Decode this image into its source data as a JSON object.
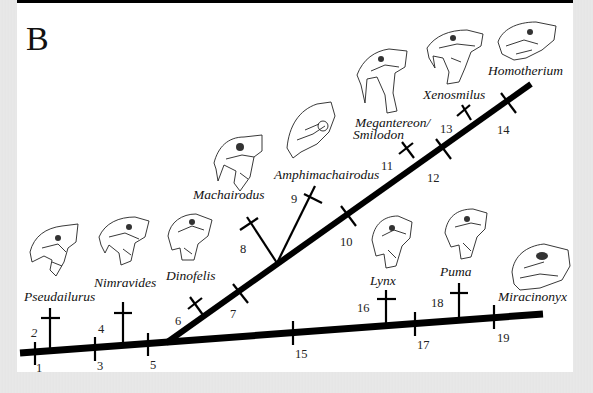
{
  "panel": {
    "label": "B"
  },
  "colors": {
    "line": "#000000",
    "background": "#ffffff",
    "frame": "#e6e6e6"
  },
  "taxa": [
    {
      "id": "pseudailurus",
      "name": "Pseudailurus"
    },
    {
      "id": "nimravides",
      "name": "Nimravides"
    },
    {
      "id": "dinofelis",
      "name": "Dinofelis"
    },
    {
      "id": "machairodus",
      "name": "Machairodus"
    },
    {
      "id": "amphimachairodus",
      "name": "Amphimachairodus"
    },
    {
      "id": "megantereon",
      "name": "Megantereon/"
    },
    {
      "id": "smilodon",
      "name": "Smilodon"
    },
    {
      "id": "xenosmilus",
      "name": "Xenosmilus"
    },
    {
      "id": "homotherium",
      "name": "Homotherium"
    },
    {
      "id": "lynx",
      "name": "Lynx"
    },
    {
      "id": "puma",
      "name": "Puma"
    },
    {
      "id": "miracinonyx",
      "name": "Miracinonyx"
    }
  ],
  "nodes": [
    "1",
    "2",
    "3",
    "4",
    "5",
    "6",
    "7",
    "8",
    "9",
    "10",
    "11",
    "12",
    "13",
    "14",
    "15",
    "16",
    "17",
    "18",
    "19"
  ]
}
